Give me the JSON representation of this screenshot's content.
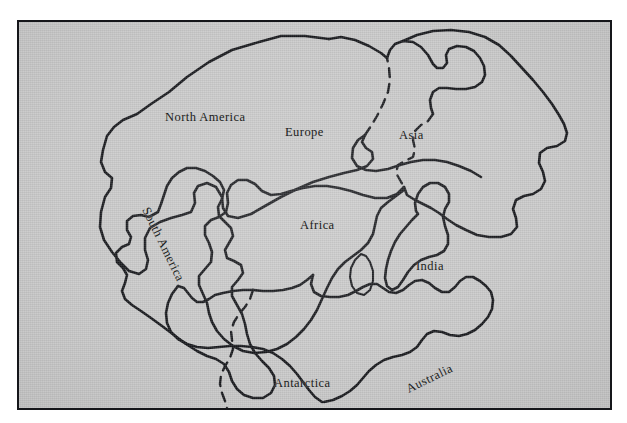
{
  "figure": {
    "type": "map-illustration",
    "frame": {
      "border_color": "#15161a",
      "fill_color": "#c9c9c9",
      "page_color": "#ffffff"
    },
    "line_color": "#17181c"
  },
  "labels": {
    "north_america": "North America",
    "europe": "Europe",
    "asia": "Asia",
    "africa": "Africa",
    "south_america": "South America",
    "india": "India",
    "australia": "Australia",
    "antarctica": "Antarctica"
  }
}
